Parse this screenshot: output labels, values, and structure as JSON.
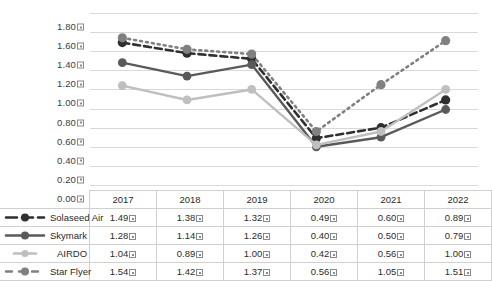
{
  "chart_title": "",
  "glyph": {
    "tofu_note": "missing-glyph box shown after every numeric value",
    "axis_tick_suffix": "□"
  },
  "colors": {
    "solaseed": "#2f2f2f",
    "skymark": "#5a5a5a",
    "airdo": "#bfbfbf",
    "starflyer": "#808080",
    "gridline": "#d9d9d9",
    "table_border": "#d0d0d0",
    "text": "#2b2b2b"
  },
  "chart_data": {
    "type": "line",
    "title": "",
    "xlabel": "",
    "ylabel": "",
    "ylim": [
      0.0,
      1.8
    ],
    "ytick_step": 0.2,
    "grid": true,
    "legend_position": "left-table",
    "categories": [
      "2017",
      "2018",
      "2019",
      "2020",
      "2021",
      "2022"
    ],
    "ytick_labels": [
      "0.00",
      "0.20",
      "0.40",
      "0.60",
      "0.80",
      "1.00",
      "1.20",
      "1.40",
      "1.60",
      "1.80"
    ],
    "series": [
      {
        "name": "Solaseed Air",
        "style": "dashed",
        "color": "#2f2f2f",
        "values": [
          1.49,
          1.38,
          1.32,
          0.49,
          0.6,
          0.89
        ],
        "labels": [
          "1.49",
          "1.38",
          "1.32",
          "0.49",
          "0.60",
          "0.89"
        ]
      },
      {
        "name": "Skymark",
        "style": "solid",
        "color": "#5a5a5a",
        "values": [
          1.28,
          1.14,
          1.26,
          0.4,
          0.5,
          0.79
        ],
        "labels": [
          "1.28",
          "1.14",
          "1.26",
          "0.40",
          "0.50",
          "0.79"
        ]
      },
      {
        "name": "AIRDO",
        "style": "solid-light",
        "color": "#bfbfbf",
        "values": [
          1.04,
          0.89,
          1.0,
          0.42,
          0.56,
          1.0
        ],
        "labels": [
          "1.04",
          "0.89",
          "1.00",
          "0.42",
          "0.56",
          "1.00"
        ]
      },
      {
        "name": "Star Flyer",
        "style": "long-dashed",
        "color": "#808080",
        "values": [
          1.54,
          1.42,
          1.37,
          0.56,
          1.05,
          1.51
        ],
        "labels": [
          "1.54",
          "1.42",
          "1.37",
          "0.56",
          "1.05",
          "1.51"
        ]
      }
    ]
  },
  "table": {
    "corner": "",
    "year_headers": [
      "2017",
      "2018",
      "2019",
      "2020",
      "2021",
      "2022"
    ],
    "rows": [
      {
        "name": "Solaseed Air",
        "values": [
          "1.49",
          "1.38",
          "1.32",
          "0.49",
          "0.60",
          "0.89"
        ]
      },
      {
        "name": "Skymark",
        "values": [
          "1.28",
          "1.14",
          "1.26",
          "0.40",
          "0.50",
          "0.79"
        ]
      },
      {
        "name": "AIRDO",
        "values": [
          "1.04",
          "0.89",
          "1.00",
          "0.42",
          "0.56",
          "1.00"
        ]
      },
      {
        "name": "Star Flyer",
        "values": [
          "1.54",
          "1.42",
          "1.37",
          "0.56",
          "1.05",
          "1.51"
        ]
      }
    ]
  }
}
